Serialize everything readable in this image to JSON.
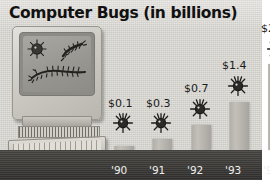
{
  "title": "Computer Bugs (in billions)",
  "colors": {
    "background": "#d9d7d2",
    "bar": "#b3b0aa",
    "baseline_band": "#3e3d3a",
    "year_label": "#efeeec",
    "value_label": "#1b1b1b",
    "title": "#111111"
  },
  "illustration": {
    "name": "desktop-computer",
    "parts": [
      "monitor",
      "screen",
      "vent-strip",
      "keyboard"
    ],
    "screen_doodles": [
      "spiky-bug",
      "caterpillar-bug",
      "worm-bug"
    ]
  },
  "chart_data": {
    "type": "bar",
    "title": "Computer Bugs (in billions)",
    "xlabel": "",
    "ylabel": "",
    "categories": [
      "'90",
      "'91",
      "'92",
      "'93",
      "'94"
    ],
    "values": [
      0.1,
      0.3,
      0.7,
      1.4,
      2.7
    ],
    "value_labels": [
      "$0.1",
      "$0.3",
      "$0.7",
      "$1.4",
      "$2.7"
    ],
    "ylim": [
      0,
      3.0
    ],
    "grid": false,
    "legend": false,
    "bar_toppers": "bug-icon"
  },
  "axis": {
    "years": [
      {
        "label": "'90"
      },
      {
        "label": "'91"
      },
      {
        "label": "'92"
      },
      {
        "label": "'93"
      },
      {
        "label": "'94"
      }
    ]
  },
  "bars": [
    {
      "label": "$0.1",
      "value": 0.1
    },
    {
      "label": "$0.3",
      "value": 0.3
    },
    {
      "label": "$0.7",
      "value": 0.7
    },
    {
      "label": "$1.4",
      "value": 1.4
    },
    {
      "label": "$2.7",
      "value": 2.7
    }
  ]
}
